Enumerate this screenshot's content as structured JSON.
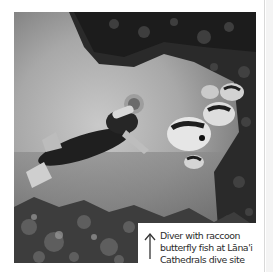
{
  "photo": {
    "subject": "underwater-diver-with-butterfly-fish",
    "tone": "grayscale"
  },
  "caption": {
    "arrow_icon": "up-arrow-icon",
    "lines": [
      "Diver with raccoon",
      "butterfly fish at Lāna'i",
      "Cathedrals dive site"
    ]
  },
  "colors": {
    "caption_text": "#2b2b2b",
    "caption_bg": "#ffffff",
    "page_edge": "#d9d9d9"
  }
}
